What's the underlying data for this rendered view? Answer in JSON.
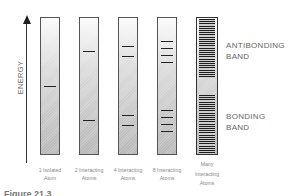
{
  "diagram": {
    "axis_label": "ENERGY",
    "columns": [
      {
        "label_line1": "1 Isolated",
        "label_line2": "Atom",
        "levels_y": [
          86
        ]
      },
      {
        "label_line1": "2 Interacting",
        "label_line2": "Atoms",
        "levels_y": [
          51,
          120
        ]
      },
      {
        "label_line1": "4 Interacting",
        "label_line2": "Atoms",
        "levels_y": [
          46,
          56,
          115,
          125
        ]
      },
      {
        "label_line1": "8 Interacting",
        "label_line2": "Atoms",
        "levels_y": [
          41,
          48,
          55,
          62,
          110,
          117,
          124,
          131
        ]
      },
      {
        "label_line1": "Many",
        "label_line2": "Interacting",
        "label_line3": "Atoms",
        "bands": [
          "antibonding",
          "bonding"
        ]
      }
    ],
    "antibonding_label_line1": "ANTIBONDING",
    "antibonding_label_line2": "BAND",
    "bonding_label_line1": "BONDING",
    "bonding_label_line2": "BAND",
    "figure_label": "Figure 21.3"
  }
}
